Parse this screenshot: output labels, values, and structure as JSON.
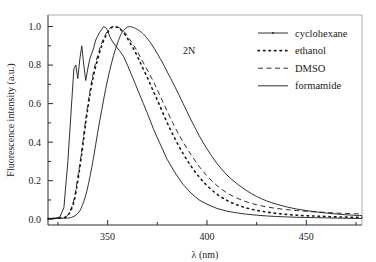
{
  "figure": {
    "annotation": "2N",
    "background": "#ffffff",
    "line_color": "#1a1a1a"
  },
  "legend": {
    "position": "top-right",
    "entries": [
      {
        "label": "cyclohexane",
        "style": "solid-marker",
        "dash": "none"
      },
      {
        "label": "ethanol",
        "style": "dotted",
        "dash": "1.5 4"
      },
      {
        "label": "DMSO",
        "style": "dashed",
        "dash": "5 3.5"
      },
      {
        "label": "formamide",
        "style": "solid",
        "dash": "none"
      }
    ]
  },
  "chart_data": {
    "type": "line",
    "title": "",
    "subtitle": "",
    "xlabel": "λ (nm)",
    "ylabel": "Fluorescence intensity (a.u.)",
    "xlim": [
      320,
      478
    ],
    "ylim": [
      -0.03,
      1.06
    ],
    "xticks": [
      350,
      400,
      450
    ],
    "xticklabels": [
      "350",
      "400",
      "450"
    ],
    "xminorticks": [
      325,
      375,
      425,
      475
    ],
    "yticks": [
      0.0,
      0.2,
      0.4,
      0.6,
      0.8,
      1.0
    ],
    "yticklabels": [
      "0.0",
      "0.2",
      "0.4",
      "0.6",
      "0.8",
      "1.0"
    ],
    "yminorticks": [
      0.1,
      0.3,
      0.5,
      0.7,
      0.9
    ],
    "grid": false,
    "legend_position": "top-right",
    "annotations": [
      {
        "text": "2N",
        "x": 391,
        "y": 0.86
      }
    ],
    "series": [
      {
        "name": "cyclohexane",
        "dash": "none",
        "markers": true,
        "x": [
          320,
          324,
          326,
          328,
          330,
          332,
          333,
          334,
          335,
          336,
          337,
          338,
          339,
          340,
          341,
          342,
          343,
          344,
          345,
          346,
          347,
          348,
          349,
          350,
          351,
          352,
          354,
          356,
          358,
          360,
          362,
          364,
          366,
          368,
          370,
          373,
          376,
          380,
          384,
          388,
          392,
          396,
          400,
          405,
          410,
          415,
          420,
          425,
          430,
          435,
          440,
          445,
          450,
          455,
          460,
          465,
          470,
          475,
          478
        ],
        "y": [
          0.003,
          0.006,
          0.012,
          0.06,
          0.3,
          0.62,
          0.78,
          0.8,
          0.73,
          0.83,
          0.9,
          0.8,
          0.72,
          0.78,
          0.83,
          0.86,
          0.89,
          0.93,
          0.95,
          0.97,
          0.985,
          1.0,
          0.995,
          0.98,
          0.95,
          0.93,
          0.9,
          0.875,
          0.845,
          0.8,
          0.75,
          0.7,
          0.65,
          0.6,
          0.55,
          0.47,
          0.4,
          0.31,
          0.24,
          0.18,
          0.135,
          0.1,
          0.078,
          0.056,
          0.042,
          0.033,
          0.026,
          0.021,
          0.017,
          0.014,
          0.012,
          0.01,
          0.009,
          0.008,
          0.007,
          0.006,
          0.005,
          0.004,
          0.004
        ]
      },
      {
        "name": "ethanol",
        "dash": "1.5 4",
        "markers": false,
        "x": [
          320,
          326,
          330,
          333,
          335,
          337,
          339,
          341,
          343,
          345,
          347,
          349,
          351,
          353,
          355,
          357,
          359,
          361,
          363,
          365,
          367,
          370,
          373,
          376,
          380,
          384,
          388,
          392,
          396,
          400,
          405,
          410,
          415,
          420,
          425,
          430,
          435,
          440,
          445,
          450,
          455,
          460,
          465,
          470,
          475,
          478
        ],
        "y": [
          0.003,
          0.006,
          0.02,
          0.09,
          0.2,
          0.34,
          0.5,
          0.64,
          0.75,
          0.83,
          0.9,
          0.95,
          0.985,
          1.0,
          0.995,
          0.98,
          0.955,
          0.92,
          0.885,
          0.845,
          0.8,
          0.735,
          0.665,
          0.595,
          0.5,
          0.415,
          0.34,
          0.275,
          0.22,
          0.175,
          0.13,
          0.098,
          0.075,
          0.058,
          0.046,
          0.037,
          0.03,
          0.025,
          0.021,
          0.018,
          0.016,
          0.014,
          0.012,
          0.011,
          0.01,
          0.01
        ]
      },
      {
        "name": "DMSO",
        "dash": "5 3.5",
        "markers": false,
        "x": [
          320,
          326,
          330,
          333,
          335,
          337,
          339,
          341,
          343,
          345,
          347,
          349,
          351,
          353,
          355,
          357,
          359,
          361,
          363,
          365,
          367,
          370,
          373,
          376,
          380,
          384,
          388,
          392,
          396,
          400,
          405,
          410,
          415,
          420,
          425,
          430,
          435,
          440,
          445,
          450,
          455,
          460,
          465,
          470,
          475,
          478
        ],
        "y": [
          0.003,
          0.007,
          0.022,
          0.1,
          0.22,
          0.36,
          0.52,
          0.66,
          0.77,
          0.85,
          0.915,
          0.96,
          0.99,
          1.0,
          0.998,
          0.985,
          0.965,
          0.935,
          0.905,
          0.87,
          0.83,
          0.775,
          0.715,
          0.65,
          0.56,
          0.475,
          0.4,
          0.335,
          0.275,
          0.225,
          0.175,
          0.137,
          0.11,
          0.09,
          0.075,
          0.064,
          0.056,
          0.05,
          0.045,
          0.041,
          0.038,
          0.035,
          0.032,
          0.03,
          0.028,
          0.027
        ]
      },
      {
        "name": "formamide",
        "dash": "none",
        "markers": false,
        "x": [
          320,
          328,
          332,
          335,
          337,
          339,
          341,
          343,
          345,
          347,
          349,
          351,
          353,
          355,
          357,
          359,
          361,
          363,
          365,
          367,
          369,
          372,
          375,
          378,
          381,
          384,
          388,
          392,
          396,
          400,
          405,
          410,
          415,
          420,
          425,
          430,
          435,
          440,
          445,
          450,
          455,
          460,
          465,
          470,
          475,
          478
        ],
        "y": [
          0.003,
          0.005,
          0.01,
          0.03,
          0.065,
          0.125,
          0.215,
          0.325,
          0.45,
          0.565,
          0.675,
          0.77,
          0.85,
          0.915,
          0.965,
          0.99,
          1.0,
          0.995,
          0.985,
          0.97,
          0.95,
          0.91,
          0.86,
          0.805,
          0.745,
          0.685,
          0.6,
          0.515,
          0.435,
          0.365,
          0.29,
          0.23,
          0.185,
          0.148,
          0.118,
          0.095,
          0.078,
          0.064,
          0.053,
          0.045,
          0.038,
          0.032,
          0.027,
          0.023,
          0.02,
          0.019
        ]
      }
    ]
  }
}
